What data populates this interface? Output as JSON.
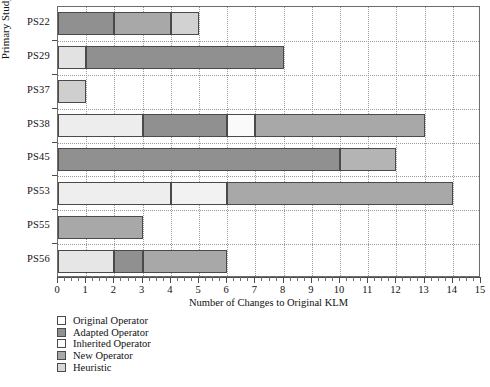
{
  "chart_data": {
    "type": "bar",
    "orientation": "horizontal",
    "stacked": true,
    "title": "",
    "xlabel": "Number of Changes to Original KLM",
    "ylabel": "Primary Study no.",
    "xlim": [
      0,
      15
    ],
    "xticks": [
      0,
      1,
      2,
      3,
      4,
      5,
      6,
      7,
      8,
      9,
      10,
      11,
      12,
      13,
      14,
      15
    ],
    "xtick_labels": [
      "0",
      "1",
      "2",
      "3",
      "4",
      "5",
      "6",
      "7",
      "8",
      "9",
      "10",
      "11",
      "12",
      "13",
      "14",
      "15"
    ],
    "grid": true,
    "grid_style": "dotted",
    "legend_position": "below-left",
    "categories": [
      "PS22",
      "PS29",
      "PS37",
      "PS38",
      "PS45",
      "PS53",
      "PS55",
      "PS56"
    ],
    "series": [
      {
        "name": "Original Operator",
        "color": "#ffffff",
        "values": [
          0,
          0,
          0,
          3,
          0,
          4,
          0,
          0
        ]
      },
      {
        "name": "Adapted Operator",
        "color": "#909090",
        "values": [
          2,
          7,
          0,
          3,
          10,
          0,
          0,
          1
        ]
      },
      {
        "name": "Inherited Operator",
        "color": "#fafafa",
        "values": [
          0,
          0,
          0,
          1,
          0,
          0,
          0,
          0
        ]
      },
      {
        "name": "New Operator",
        "color": "#a8a8a8",
        "values": [
          2,
          0,
          0,
          6,
          2,
          8,
          3,
          3
        ]
      },
      {
        "name": "Heuristic",
        "color": "#d2d2d2",
        "values": [
          1,
          1,
          1,
          0,
          0,
          2,
          0,
          2
        ]
      }
    ],
    "totals": [
      5,
      8,
      1,
      13,
      12,
      14,
      3,
      6
    ],
    "bars": [
      {
        "category": "PS22",
        "total": 5,
        "segments": [
          {
            "series": "Adapted Operator",
            "start": 0,
            "end": 2,
            "value": 2,
            "color": "#909090"
          },
          {
            "series": "New Operator",
            "start": 2,
            "end": 4,
            "value": 2,
            "color": "#a8a8a8"
          },
          {
            "series": "Heuristic",
            "start": 4,
            "end": 5,
            "value": 1,
            "color": "#d2d2d2"
          }
        ]
      },
      {
        "category": "PS29",
        "total": 8,
        "segments": [
          {
            "series": "Heuristic",
            "start": 0,
            "end": 1,
            "value": 1,
            "color": "#e2e2e2"
          },
          {
            "series": "Adapted Operator",
            "start": 1,
            "end": 8,
            "value": 7,
            "color": "#909090"
          }
        ]
      },
      {
        "category": "PS37",
        "total": 1,
        "segments": [
          {
            "series": "Heuristic",
            "start": 0,
            "end": 1,
            "value": 1,
            "color": "#cfcfcf"
          }
        ]
      },
      {
        "category": "PS38",
        "total": 13,
        "segments": [
          {
            "series": "Original Operator",
            "start": 0,
            "end": 3,
            "value": 3,
            "color": "#ededed"
          },
          {
            "series": "Adapted Operator",
            "start": 3,
            "end": 6,
            "value": 3,
            "color": "#909090"
          },
          {
            "series": "Inherited Operator",
            "start": 6,
            "end": 7,
            "value": 1,
            "color": "#fafafa"
          },
          {
            "series": "New Operator",
            "start": 7,
            "end": 13,
            "value": 6,
            "color": "#a8a8a8"
          }
        ]
      },
      {
        "category": "PS45",
        "total": 12,
        "segments": [
          {
            "series": "Adapted Operator",
            "start": 0,
            "end": 10,
            "value": 10,
            "color": "#909090"
          },
          {
            "series": "New Operator",
            "start": 10,
            "end": 12,
            "value": 2,
            "color": "#b4b4b4"
          }
        ]
      },
      {
        "category": "PS53",
        "total": 14,
        "segments": [
          {
            "series": "Original Operator",
            "start": 0,
            "end": 4,
            "value": 4,
            "color": "#eeeeee"
          },
          {
            "series": "Heuristic",
            "start": 4,
            "end": 6,
            "value": 2,
            "color": "#f2f2f2"
          },
          {
            "series": "New Operator",
            "start": 6,
            "end": 14,
            "value": 8,
            "color": "#a8a8a8"
          }
        ]
      },
      {
        "category": "PS55",
        "total": 3,
        "segments": [
          {
            "series": "New Operator",
            "start": 0,
            "end": 3,
            "value": 3,
            "color": "#a8a8a8"
          }
        ]
      },
      {
        "category": "PS56",
        "total": 6,
        "segments": [
          {
            "series": "Heuristic",
            "start": 0,
            "end": 2,
            "value": 2,
            "color": "#e6e6e6"
          },
          {
            "series": "Adapted Operator",
            "start": 2,
            "end": 3,
            "value": 1,
            "color": "#909090"
          },
          {
            "series": "New Operator",
            "start": 3,
            "end": 6,
            "value": 3,
            "color": "#a8a8a8"
          }
        ]
      }
    ]
  },
  "axis": {
    "y_title": "Primary Study no.",
    "x_title": "Number of Changes to Original KLM",
    "y_categories": [
      "PS22",
      "PS29",
      "PS37",
      "PS38",
      "PS45",
      "PS53",
      "PS55",
      "PS56"
    ],
    "x_tick_labels": [
      "0",
      "1",
      "2",
      "3",
      "4",
      "5",
      "6",
      "7",
      "8",
      "9",
      "10",
      "11",
      "12",
      "13",
      "14",
      "15"
    ]
  },
  "legend": {
    "items": [
      {
        "label": "Original Operator",
        "color": "#ffffff"
      },
      {
        "label": "Adapted Operator",
        "color": "#909090"
      },
      {
        "label": "Inherited Operator",
        "color": "#fcfcfc"
      },
      {
        "label": "New Operator",
        "color": "#a8a8a8"
      },
      {
        "label": "Heuristic",
        "color": "#d8d8d8"
      }
    ]
  }
}
